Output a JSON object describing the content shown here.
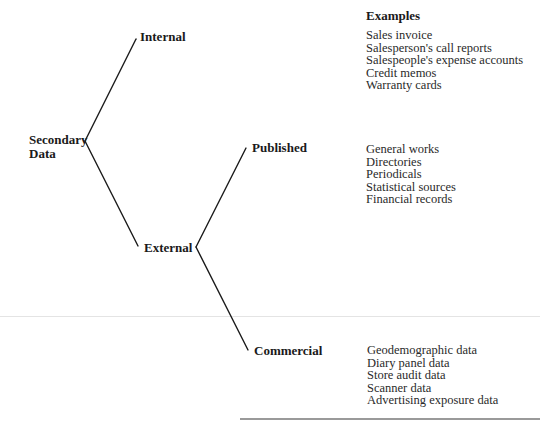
{
  "diagram": {
    "root": {
      "label_line1": "Secondary",
      "label_line2": "Data"
    },
    "branches": {
      "internal": {
        "label": "Internal"
      },
      "external": {
        "label": "External"
      },
      "published": {
        "label": "Published"
      },
      "commercial": {
        "label": "Commercial"
      }
    },
    "examples_heading": "Examples",
    "examples": {
      "internal": [
        "Sales invoice",
        "Salesperson's call reports",
        "Salespeople's expense accounts",
        "Credit memos",
        "Warranty cards"
      ],
      "published": [
        "General works",
        "Directories",
        "Periodicals",
        "Statistical sources",
        "Financial records"
      ],
      "commercial": [
        "Geodemographic data",
        "Diary panel data",
        "Store audit data",
        "Scanner data",
        "Advertising exposure data"
      ]
    },
    "line_color": "#1a1a1a"
  }
}
